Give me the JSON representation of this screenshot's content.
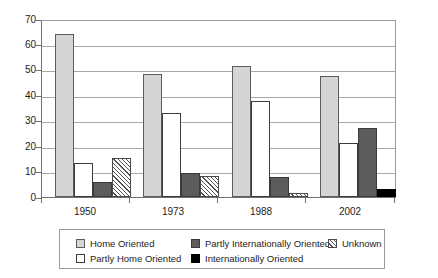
{
  "chart_data": {
    "type": "bar",
    "title": "",
    "subtitle": "",
    "xlabel": "",
    "ylabel": "",
    "categories": [
      "1950",
      "1973",
      "1988",
      "2002"
    ],
    "ylim": [
      0,
      70
    ],
    "yticks": [
      0,
      10,
      20,
      30,
      40,
      50,
      60,
      70
    ],
    "ytick_labels": [
      "0",
      "10",
      "20",
      "30",
      "40",
      "50",
      "60",
      "70"
    ],
    "grid": true,
    "legend_position": "bottom",
    "series": [
      {
        "name": "Home Oriented",
        "color": "#d5d5d5",
        "pattern": "solid",
        "values": [
          65,
          49,
          52,
          48
        ]
      },
      {
        "name": "Partly Home Oriented",
        "color": "#ffffff",
        "pattern": "solid",
        "values": [
          13.5,
          33.5,
          38,
          21.5
        ]
      },
      {
        "name": "Partly Internationally Oriented",
        "color": "#5c5c5c",
        "pattern": "solid",
        "values": [
          6,
          9.5,
          8,
          27.5
        ]
      },
      {
        "name": "Internationally Oriented",
        "color": "#000000",
        "pattern": "solid",
        "values": [
          0,
          0,
          0,
          3
        ]
      },
      {
        "name": "Unknown",
        "color": "#ffffff",
        "pattern": "diagonal-hatch",
        "values": [
          15.5,
          8.5,
          1.5,
          0
        ]
      }
    ]
  },
  "axes": {
    "y_ticks": [
      {
        "label": "70",
        "value": 70
      },
      {
        "label": "60",
        "value": 60
      },
      {
        "label": "50",
        "value": 50
      },
      {
        "label": "40",
        "value": 40
      },
      {
        "label": "30",
        "value": 30
      },
      {
        "label": "20",
        "value": 20
      },
      {
        "label": "10",
        "value": 10
      },
      {
        "label": "0",
        "value": 0
      }
    ],
    "x_ticks": [
      {
        "label": "1950"
      },
      {
        "label": "1973"
      },
      {
        "label": "1988"
      },
      {
        "label": "2002"
      }
    ]
  },
  "legend": {
    "entries": [
      {
        "label": "Home Oriented",
        "swatch": "home-oriented-swatch"
      },
      {
        "label": "Partly Home Oriented",
        "swatch": "partly-home-oriented-swatch"
      },
      {
        "label": "Partly Internationally Oriented",
        "swatch": "partly-internationally-oriented-swatch"
      },
      {
        "label": "Internationally Oriented",
        "swatch": "internationally-oriented-swatch"
      },
      {
        "label": "Unknown",
        "swatch": "unknown-swatch"
      }
    ]
  }
}
